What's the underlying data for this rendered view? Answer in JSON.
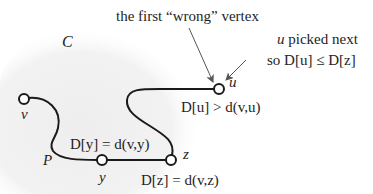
{
  "diagram": {
    "type": "graph-path-illustration",
    "cloud_label": "C",
    "colors": {
      "cloud": "#f1f1f1",
      "edge": "#1a1a1a",
      "arrow": "#555555",
      "text": "#1e1e1e",
      "node_fill": "#ffffff"
    },
    "nodes": [
      {
        "id": "v",
        "label": "v"
      },
      {
        "id": "y",
        "label": "y"
      },
      {
        "id": "z",
        "label": "z"
      },
      {
        "id": "u",
        "label": "u"
      }
    ],
    "path_label": "P",
    "annotations": {
      "top": {
        "prefix": "the first ",
        "quoted": "“wrong”",
        "suffix": " vertex"
      },
      "right_line1_var": "u",
      "right_line1_rest": " picked next",
      "right_line2": "so D[u] ≤ D[z]",
      "u_condition": "D[u] > d(v,u)",
      "y_condition": "D[y] = d(v,y)",
      "z_condition": "D[z] = d(v,z)"
    }
  }
}
